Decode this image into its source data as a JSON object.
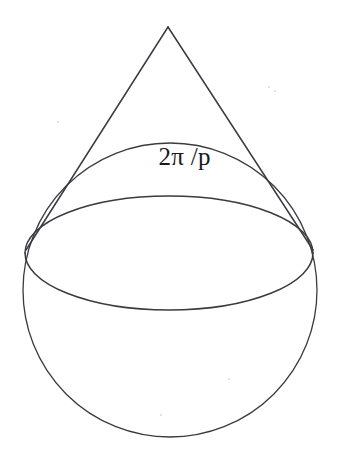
{
  "figure": {
    "background_color": "#ffffff",
    "stroke_color": "#3a3a40",
    "label": {
      "text": "2π /p",
      "meaning": "two pi over p",
      "color": "#1b1b1f",
      "font_size_px": 25
    },
    "geometry": {
      "canvas": {
        "width": 337,
        "height": 459
      },
      "cone": {
        "apex": {
          "x": 168,
          "y": 27
        },
        "left_tangent": {
          "x": 26,
          "y": 250
        },
        "right_tangent": {
          "x": 313,
          "y": 250
        }
      },
      "base_ellipse": {
        "center": {
          "x": 169,
          "y": 253
        },
        "rx": 144,
        "ry": 57,
        "top_y": 196,
        "bottom_y": 310
      },
      "sphere_circle": {
        "center": {
          "x": 170,
          "y": 290
        },
        "radius": 147,
        "left_x": 23,
        "right_x": 318,
        "bottom_y": 437
      }
    },
    "speckles": [
      {
        "x": 268,
        "y": 86,
        "size": 2
      },
      {
        "x": 274,
        "y": 90,
        "size": 2
      },
      {
        "x": 228,
        "y": 378,
        "size": 2
      },
      {
        "x": 160,
        "y": 414,
        "size": 2
      },
      {
        "x": 57,
        "y": 121,
        "size": 2
      }
    ]
  }
}
